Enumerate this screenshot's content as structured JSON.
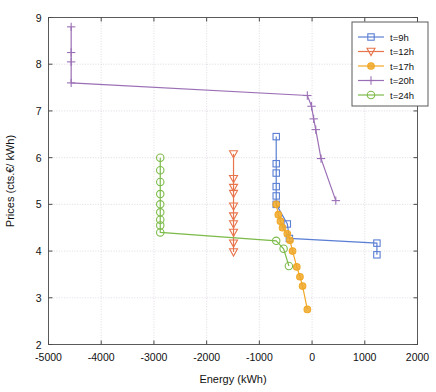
{
  "chart_data": {
    "type": "line",
    "title": "",
    "xlabel": "Energy (kWh)",
    "ylabel": "Prices (cts.€/ kWh)",
    "xlim": [
      -5000,
      2000
    ],
    "ylim": [
      2,
      9
    ],
    "xticks": [
      -5000,
      -4000,
      -3000,
      -2000,
      -1000,
      0,
      1000,
      2000
    ],
    "xticklabels": [
      "-5000",
      "-4000",
      "-3000",
      "-2000",
      "-1000",
      "0",
      "1000",
      "2000"
    ],
    "yticks": [
      2,
      3,
      4,
      5,
      6,
      7,
      8,
      9
    ],
    "yticklabels": [
      "2",
      "3",
      "4",
      "5",
      "6",
      "7",
      "8",
      "9"
    ],
    "grid": true,
    "legend_position": "top-right",
    "series": [
      {
        "name": "t=9h",
        "color": "#5b7fd4",
        "marker": "square",
        "points": [
          [
            -680,
            6.45
          ],
          [
            -680,
            5.87
          ],
          [
            -680,
            5.67
          ],
          [
            -680,
            5.38
          ],
          [
            -680,
            5.18
          ],
          [
            -680,
            5.0
          ],
          [
            -470,
            4.58
          ],
          [
            -430,
            4.27
          ],
          [
            1230,
            4.17
          ],
          [
            1230,
            3.92
          ]
        ]
      },
      {
        "name": "t=12h",
        "color": "#e8744b",
        "marker": "triangle-down",
        "points": [
          [
            -1490,
            6.08
          ],
          [
            -1490,
            5.55
          ],
          [
            -1490,
            5.36
          ],
          [
            -1490,
            5.23
          ],
          [
            -1490,
            4.96
          ],
          [
            -1490,
            4.75
          ],
          [
            -1490,
            4.58
          ],
          [
            -1490,
            4.4
          ],
          [
            -1490,
            4.17
          ],
          [
            -1490,
            3.98
          ]
        ]
      },
      {
        "name": "t=17h",
        "color": "#f0a828",
        "marker": "circle-dot",
        "points": [
          [
            -680,
            5.0
          ],
          [
            -640,
            4.78
          ],
          [
            -600,
            4.64
          ],
          [
            -560,
            4.5
          ],
          [
            -470,
            4.37
          ],
          [
            -420,
            4.23
          ],
          [
            -370,
            4.0
          ],
          [
            -290,
            3.66
          ],
          [
            -230,
            3.45
          ],
          [
            -180,
            3.25
          ],
          [
            -90,
            2.75
          ]
        ]
      },
      {
        "name": "t=20h",
        "color": "#9b6fb5",
        "marker": "plus",
        "points": [
          [
            -4570,
            8.8
          ],
          [
            -4570,
            8.25
          ],
          [
            -4570,
            8.05
          ],
          [
            -4570,
            7.6
          ],
          [
            -90,
            7.33
          ],
          [
            -10,
            7.1
          ],
          [
            30,
            6.83
          ],
          [
            70,
            6.6
          ],
          [
            170,
            5.98
          ],
          [
            450,
            5.08
          ]
        ]
      },
      {
        "name": "t=24h",
        "color": "#7dbb4a",
        "marker": "circle",
        "points": [
          [
            -2880,
            6.0
          ],
          [
            -2880,
            5.73
          ],
          [
            -2880,
            5.48
          ],
          [
            -2880,
            5.22
          ],
          [
            -2880,
            5.0
          ],
          [
            -2880,
            4.83
          ],
          [
            -2880,
            4.67
          ],
          [
            -2880,
            4.55
          ],
          [
            -2880,
            4.4
          ],
          [
            -680,
            4.22
          ],
          [
            -540,
            4.05
          ],
          [
            -440,
            3.68
          ]
        ]
      }
    ]
  },
  "legend": {
    "entries": [
      {
        "label": "t=9h"
      },
      {
        "label": "t=12h"
      },
      {
        "label": "t=17h"
      },
      {
        "label": "t=20h"
      },
      {
        "label": "t=24h"
      }
    ]
  }
}
